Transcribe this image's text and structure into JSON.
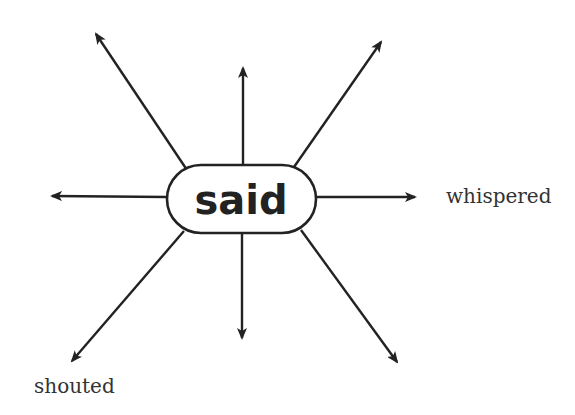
{
  "diagram": {
    "type": "word-web",
    "center": {
      "word": "said",
      "box": {
        "x": 167,
        "y": 165,
        "width": 149,
        "height": 68,
        "rx": 34
      },
      "text_pos": {
        "x": 241,
        "y": 214
      }
    },
    "colors": {
      "stroke": "#222222",
      "text": "#222222",
      "label": "#333333",
      "background": "#ffffff"
    },
    "arrows": [
      {
        "id": "up-left",
        "from": [
          187,
          170
        ],
        "to": [
          96,
          34
        ]
      },
      {
        "id": "up",
        "from": [
          243,
          165
        ],
        "to": [
          243,
          68
        ]
      },
      {
        "id": "up-right",
        "from": [
          294,
          167
        ],
        "to": [
          381,
          42
        ]
      },
      {
        "id": "left",
        "from": [
          167,
          197
        ],
        "to": [
          52,
          196
        ]
      },
      {
        "id": "right",
        "from": [
          316,
          197
        ],
        "to": [
          415,
          197
        ]
      },
      {
        "id": "down-left",
        "from": [
          184,
          231
        ],
        "to": [
          72,
          361
        ]
      },
      {
        "id": "down",
        "from": [
          242,
          233
        ],
        "to": [
          242,
          338
        ]
      },
      {
        "id": "down-right",
        "from": [
          301,
          230
        ],
        "to": [
          397,
          362
        ]
      }
    ],
    "labels": [
      {
        "text": "whispered",
        "x": 446,
        "y": 203,
        "attached_to": "right"
      },
      {
        "text": "shouted",
        "x": 34,
        "y": 393,
        "attached_to": "down-left"
      }
    ]
  }
}
